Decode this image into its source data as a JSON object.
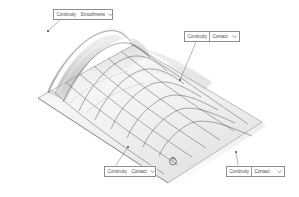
{
  "app": {
    "title": "Surface Continuity Display",
    "background_color": "#ffffff"
  },
  "viewport": {
    "name": "3d-surface-viewport",
    "model": {
      "description": "Shaded NURBS wave surface with isoparametric grid",
      "surface_fill_light": "#fbfbfb",
      "surface_fill_mid": "#e3e3e3",
      "surface_fill_dark": "#bfbfbf",
      "grid_line_color": "#3f3f3f",
      "outline_color": "#7a7a7a",
      "shadow_color": "#d8d8d8"
    },
    "cursor": {
      "name": "selection-cursor",
      "shape": "circle-marker",
      "x": 172,
      "y": 160
    }
  },
  "callouts": [
    {
      "id": "top-left",
      "label": "Continuity",
      "value": "Smoothness",
      "arrow_icon": "chevron-down-icon",
      "leader_from": {
        "x": 60,
        "y": 20
      },
      "leader_to": {
        "x": 48,
        "y": 31
      }
    },
    {
      "id": "top-right",
      "label": "Continuity",
      "value": "Contact",
      "arrow_icon": "chevron-down-icon",
      "leader_from": {
        "x": 196,
        "y": 42
      },
      "leader_to": {
        "x": 180,
        "y": 80
      }
    },
    {
      "id": "bottom-mid",
      "label": "Continuity",
      "value": "Contact",
      "arrow_icon": "chevron-down-icon",
      "leader_from": {
        "x": 116,
        "y": 165
      },
      "leader_to": {
        "x": 128,
        "y": 147
      }
    },
    {
      "id": "bottom-right",
      "label": "Continuity",
      "value": "Contact",
      "arrow_icon": "chevron-down-icon",
      "leader_from": {
        "x": 238,
        "y": 165
      },
      "leader_to": {
        "x": 236,
        "y": 152
      }
    }
  ],
  "colors": {
    "border": "#8d8d8d",
    "text": "#575757",
    "leader": "#6a6a6a"
  }
}
